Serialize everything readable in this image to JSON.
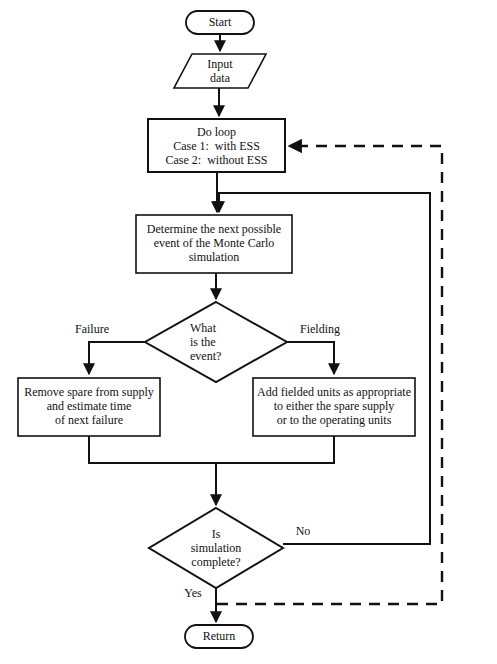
{
  "diagram": {
    "type": "flowchart",
    "stroke_color": "#111111",
    "fill_color": "#ffffff",
    "background_color": "#ffffff"
  },
  "nodes": {
    "start": {
      "shape": "terminal",
      "label": "Start"
    },
    "input": {
      "shape": "parallelogram",
      "label": "Input\ndata"
    },
    "do_loop": {
      "shape": "process",
      "label": "Do loop\nCase 1:  with ESS\nCase 2:  without ESS"
    },
    "determine_event": {
      "shape": "process",
      "label": "Determine the next possible\nevent of the Monte Carlo\nsimulation"
    },
    "what_event": {
      "shape": "decision",
      "label": "What\nis the\nevent?"
    },
    "remove_spare": {
      "shape": "process",
      "label": "Remove spare from supply\nand estimate time\nof next failure"
    },
    "add_fielded": {
      "shape": "process",
      "label": "Add fielded units as appropriate\nto either the spare supply\nor to the operating units"
    },
    "sim_complete": {
      "shape": "decision",
      "label": "Is\nsimulation\ncomplete?"
    },
    "return": {
      "shape": "terminal",
      "label": "Return"
    }
  },
  "edge_labels": {
    "failure": "Failure",
    "fielding": "Fielding",
    "no": "No",
    "yes": "Yes"
  }
}
